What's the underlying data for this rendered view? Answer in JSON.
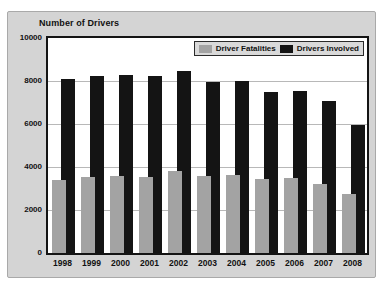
{
  "chart_data": {
    "type": "bar",
    "title": "Number of Drivers",
    "categories": [
      "1998",
      "1999",
      "2000",
      "2001",
      "2002",
      "2003",
      "2004",
      "2005",
      "2006",
      "2007",
      "2008"
    ],
    "series": [
      {
        "name": "Driver Fatalities",
        "color": "#a3a3a3",
        "values": [
          3400,
          3550,
          3600,
          3550,
          3800,
          3600,
          3650,
          3450,
          3500,
          3200,
          2750
        ]
      },
      {
        "name": "Drivers Involved",
        "color": "#141414",
        "values": [
          8100,
          8250,
          8300,
          8250,
          8450,
          7950,
          8000,
          7500,
          7550,
          7050,
          5950
        ]
      }
    ],
    "ylim": [
      0,
      10000
    ],
    "ytick_interval": 2000,
    "ytick_labels": [
      "0",
      "2000",
      "4000",
      "6000",
      "8000",
      "10000"
    ],
    "xlabel": "",
    "ylabel": "Number of Drivers",
    "grid": "horizontal",
    "legend_position": "top-right-inside",
    "bar_style": "overlapping, gray series in front offset left, black series behind offset right"
  },
  "colors": {
    "panel_background": "#d4d4d4",
    "plot_background": "#ffffff",
    "plot_border": "#141414",
    "gridline": "#b8b8b8",
    "bar_gray": "#a3a3a3",
    "bar_black": "#141414",
    "legend_background": "#d9d9d9",
    "text": "#111111"
  }
}
